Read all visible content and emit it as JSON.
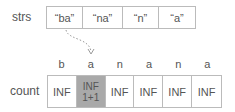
{
  "strs": {
    "label": "strs",
    "items": [
      "“ba”",
      "“na”",
      "“n”",
      "“a”"
    ],
    "widths": [
      35,
      40,
      34,
      39
    ]
  },
  "target_chars": [
    "b",
    "a",
    "n",
    "a",
    "n",
    "a"
  ],
  "count": {
    "label": "count",
    "cells": [
      {
        "value": "INF"
      },
      {
        "value": "INF",
        "sub": "1+1",
        "highlighted": true
      },
      {
        "value": "INF"
      },
      {
        "value": "INF"
      },
      {
        "value": "INF"
      },
      {
        "value": "INF"
      }
    ]
  },
  "colors": {
    "highlight": "#a9a9a9",
    "border": "#bbbbbb",
    "arrow": "#888888"
  }
}
